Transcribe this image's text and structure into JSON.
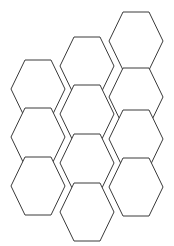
{
  "canvas": {
    "width": 174,
    "height": 246,
    "background_color": "#ffffff",
    "title": "Hexagon Grid"
  },
  "style": {
    "stroke_color": "#3a3a3a",
    "stroke_width": 1,
    "fill_color": "#ffffff"
  },
  "grid": {
    "shape": "hexagon",
    "orientation": "flat-top",
    "cell_width": 54,
    "cell_height": 58,
    "cell_side_run": 14,
    "column_step_x": 47,
    "row_step_y": 48,
    "column_offset_y": 24,
    "columns": 3,
    "total_cells": 11
  },
  "cells": [
    {
      "id": "hex-c3-r1",
      "column": 3,
      "row": 1,
      "cx": 136,
      "cy": 41
    },
    {
      "id": "hex-c2-r1",
      "column": 2,
      "row": 1,
      "cx": 87,
      "cy": 66
    },
    {
      "id": "hex-c3-r2",
      "column": 3,
      "row": 2,
      "cx": 136,
      "cy": 97
    },
    {
      "id": "hex-c1-r1",
      "column": 1,
      "row": 1,
      "cx": 38,
      "cy": 89
    },
    {
      "id": "hex-c2-r2",
      "column": 2,
      "row": 2,
      "cx": 87,
      "cy": 114
    },
    {
      "id": "hex-c3-r3",
      "column": 3,
      "row": 3,
      "cx": 136,
      "cy": 139
    },
    {
      "id": "hex-c1-r2",
      "column": 1,
      "row": 2,
      "cx": 38,
      "cy": 137
    },
    {
      "id": "hex-c2-r3",
      "column": 2,
      "row": 3,
      "cx": 87,
      "cy": 163
    },
    {
      "id": "hex-c3-r4",
      "column": 3,
      "row": 4,
      "cx": 136,
      "cy": 187
    },
    {
      "id": "hex-c1-r3",
      "column": 1,
      "row": 3,
      "cx": 38,
      "cy": 186
    },
    {
      "id": "hex-c2-r4",
      "column": 2,
      "row": 4,
      "cx": 87,
      "cy": 212
    }
  ]
}
